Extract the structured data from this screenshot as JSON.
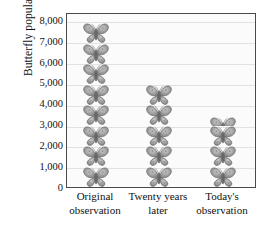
{
  "chart_data": {
    "type": "bar",
    "subtype": "pictogram",
    "title": "",
    "xlabel": "",
    "ylabel": "Butterfly populations",
    "categories": [
      "Original observation",
      "Twenty years later",
      "Today's observation"
    ],
    "category_lines": [
      [
        "Original",
        "observation"
      ],
      [
        "Twenty years",
        "later"
      ],
      [
        "Today's",
        "observation"
      ]
    ],
    "values": [
      7600,
      4800,
      3500
    ],
    "units_per_symbol": 1000,
    "symbol": "butterfly-icon",
    "symbol_counts": [
      8,
      5,
      3.5
    ],
    "ylim": [
      0,
      8400
    ],
    "yticks": [
      0,
      1000,
      2000,
      3000,
      4000,
      5000,
      6000,
      7000,
      8000
    ],
    "ytick_labels": [
      "0",
      "1,000",
      "2,000",
      "3,000",
      "4,000",
      "5,000",
      "6,000",
      "7,000",
      "8,000"
    ],
    "grid": true,
    "legend": "none",
    "colors": {
      "plot_background": "#fbfbfb",
      "frame": "#4a4a4a",
      "gridline": "#e2e2e2",
      "symbol_fill": "#9a9a9a",
      "symbol_outline": "#5c5c5c",
      "text": "#111111"
    }
  }
}
